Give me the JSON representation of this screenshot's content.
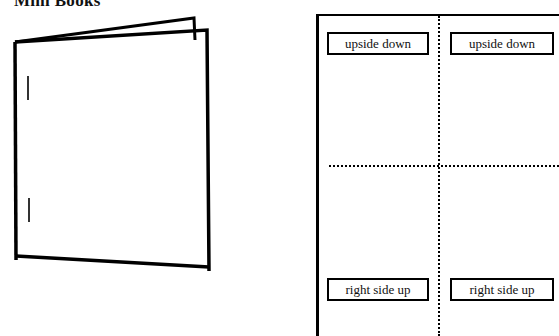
{
  "page": {
    "title": "Mini Books"
  },
  "book_illustration": {
    "description": "folded stapled mini book",
    "staples": 2
  },
  "fold_template": {
    "panels": [
      {
        "label": "upside down"
      },
      {
        "label": "upside down"
      },
      {
        "label": "right side up"
      },
      {
        "label": "right side up"
      }
    ]
  }
}
